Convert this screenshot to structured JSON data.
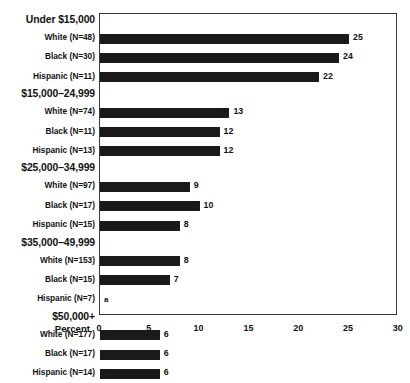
{
  "chart_data": {
    "type": "bar",
    "title": "",
    "xlabel": "Percent",
    "ylabel": "",
    "xlim": [
      0,
      30
    ],
    "xticks": [
      0,
      5,
      10,
      15,
      20,
      25,
      30
    ],
    "grid": false,
    "legend": "none",
    "orientation": "horizontal",
    "footnote_marker": "a",
    "groups": [
      {
        "label": "Under $15,000",
        "rows": [
          {
            "label": "White (N=48)",
            "value": 25,
            "value_label": "25"
          },
          {
            "label": "Black (N=30)",
            "value": 24,
            "value_label": "24"
          },
          {
            "label": "Hispanic (N=11)",
            "value": 22,
            "value_label": "22"
          }
        ]
      },
      {
        "label": "$15,000–24,999",
        "rows": [
          {
            "label": "White (N=74)",
            "value": 13,
            "value_label": "13"
          },
          {
            "label": "Black (N=11)",
            "value": 12,
            "value_label": "12"
          },
          {
            "label": "Hispanic (N=13)",
            "value": 12,
            "value_label": "12"
          }
        ]
      },
      {
        "label": "$25,000–34,999",
        "rows": [
          {
            "label": "White (N=97)",
            "value": 9,
            "value_label": "9"
          },
          {
            "label": "Black (N=17)",
            "value": 10,
            "value_label": "10"
          },
          {
            "label": "Hispanic (N=15)",
            "value": 8,
            "value_label": "8"
          }
        ]
      },
      {
        "label": "$35,000–49,999",
        "rows": [
          {
            "label": "White (N=153)",
            "value": 8,
            "value_label": "8"
          },
          {
            "label": "Black (N=15)",
            "value": 7,
            "value_label": "7"
          },
          {
            "label": "Hispanic (N=7)",
            "value": null,
            "value_label": "a"
          }
        ]
      },
      {
        "label": "$50,000+",
        "rows": [
          {
            "label": "White (N=177)",
            "value": 6,
            "value_label": "6"
          },
          {
            "label": "Black (N=17)",
            "value": 6,
            "value_label": "6"
          },
          {
            "label": "Hispanic (N=14)",
            "value": 6,
            "value_label": "6"
          }
        ]
      }
    ]
  },
  "colors": {
    "bar": "#1a1a1a",
    "frame": "#3a3a3a",
    "text": "#111111",
    "background": "#ffffff"
  }
}
